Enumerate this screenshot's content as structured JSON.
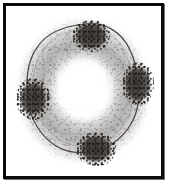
{
  "figure": {
    "caption": "",
    "frame_color": "#0d0d0d",
    "background_color": "#ffffff",
    "plate_background": "#fdfdfd",
    "width_px": 176,
    "height_px": 191
  },
  "specimen": {
    "name": "ring-shaped specimen",
    "description": "Grayscale micrograph of a circular ring-like specimen with a bright hollow centre, fine granular reticulate texture and four dark pigmented clusters spaced around the rim.",
    "outline_color": "#4a4745",
    "texture_color": "#8f8d8b",
    "cluster_color": "#3a3634",
    "lumen_color": "#ffffff",
    "clusters": [
      {
        "id": "north",
        "label": "dark cluster - top",
        "position": "top",
        "cx_pct": 55,
        "cy_pct": 18
      },
      {
        "id": "east",
        "label": "dark cluster - right",
        "position": "right",
        "cx_pct": 85,
        "cy_pct": 46
      },
      {
        "id": "south",
        "label": "dark cluster - bottom",
        "position": "bottom",
        "cx_pct": 58,
        "cy_pct": 84
      },
      {
        "id": "west",
        "label": "dark cluster - left",
        "position": "left",
        "cx_pct": 17,
        "cy_pct": 55
      }
    ]
  }
}
